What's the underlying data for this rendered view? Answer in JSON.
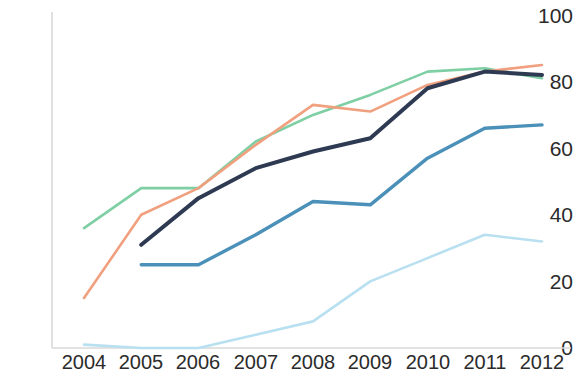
{
  "chart_data": {
    "type": "line",
    "title": "",
    "subtitle": "",
    "xlabel": "",
    "ylabel": "",
    "categories": [
      "2004",
      "2005",
      "2006",
      "2007",
      "2008",
      "2009",
      "2010",
      "2011",
      "2012"
    ],
    "x": [
      2004,
      2005,
      2006,
      2007,
      2008,
      2009,
      2010,
      2011,
      2012
    ],
    "xlim": [
      2004,
      2012
    ],
    "ylim": [
      0,
      100
    ],
    "y_ticks": [
      0,
      20,
      40,
      60,
      80,
      100
    ],
    "x_ticks": [
      "2004",
      "2005",
      "2006",
      "2007",
      "2008",
      "2009",
      "2010",
      "2011",
      "2012"
    ],
    "grid": false,
    "legend": "none",
    "series": [
      {
        "name": "series-green",
        "color": "#7ecfa4",
        "values": [
          36,
          48,
          48,
          62,
          70,
          76,
          83,
          84,
          81
        ]
      },
      {
        "name": "series-orange",
        "color": "#f0a07e",
        "values": [
          15,
          40,
          48,
          61,
          73,
          71,
          79,
          83,
          85
        ]
      },
      {
        "name": "series-navy",
        "color": "#2e3a52",
        "values": [
          null,
          31,
          45,
          54,
          59,
          63,
          78,
          83,
          82
        ]
      },
      {
        "name": "series-blue",
        "color": "#4a90b8",
        "values": [
          null,
          25,
          25,
          34,
          44,
          43,
          57,
          66,
          67
        ]
      },
      {
        "name": "series-lightblue",
        "color": "#b8e0f0",
        "values": [
          1,
          0,
          0,
          4,
          8,
          20,
          27,
          34,
          32
        ]
      }
    ]
  },
  "axes": {
    "y_labels": [
      "100",
      "80",
      "60",
      "40",
      "20",
      "0"
    ],
    "x_labels": [
      "2004",
      "2005",
      "2006",
      "2007",
      "2008",
      "2009",
      "2010",
      "2011",
      "2012"
    ]
  },
  "colors": {
    "axis": "#d9d9d9",
    "text": "#2b2b2b",
    "background": "#ffffff"
  }
}
